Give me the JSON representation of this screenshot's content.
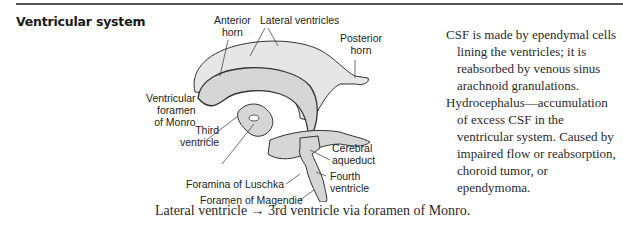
{
  "section": {
    "title": "Ventricular system"
  },
  "diagram": {
    "labels": {
      "anterior_horn": "Anterior\nhorn",
      "lateral_ventricles": "Lateral ventricles",
      "posterior_horn": "Posterior\nhorn",
      "ventricular_foramen": "Ventricular\nforamen\nof Monro",
      "third_ventricle": "Third\nventricle",
      "cerebral_aqueduct": "Cerebral\naqueduct",
      "fourth_ventricle": "Fourth\nventricle",
      "foramina_luschka": "Foramina of Luschka",
      "foramen_magendie": "Foramen of Magendie"
    },
    "colors": {
      "fill": "#d6d6d6",
      "fill_light": "#e6e6e6",
      "stroke": "#333333"
    }
  },
  "notes": [
    "CSF is made by ependymal cells lining the ventricles; it is reabsorbed by venous sinus arachnoid granulations.",
    "Hydrocephalus—accumulation of excess CSF in the ventricular system. Caused by impaired flow or reabsorption, choroid tumor, or ependymoma."
  ],
  "caption": "Lateral ventricle → 3rd ventricle via foramen of Monro."
}
